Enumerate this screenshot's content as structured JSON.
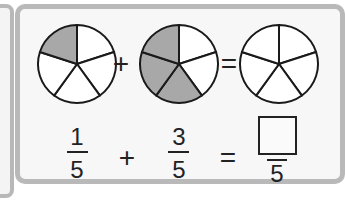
{
  "diagram": {
    "circles": [
      {
        "name": "first-addend",
        "parts": 5,
        "shaded": 1
      },
      {
        "name": "second-addend",
        "parts": 5,
        "shaded": 3
      },
      {
        "name": "sum",
        "parts": 5,
        "shaded": 0
      }
    ],
    "circle_operators": [
      "+",
      "="
    ],
    "equation": {
      "term1": {
        "numerator": "1",
        "denominator": "5"
      },
      "plus": "+",
      "term2": {
        "numerator": "3",
        "denominator": "5"
      },
      "equals": "=",
      "answer": {
        "numerator": "",
        "denominator": "5"
      }
    },
    "colors": {
      "shade": "#a8a8a8",
      "stroke": "#1a1a1a",
      "border": "#b9b9b9"
    }
  }
}
